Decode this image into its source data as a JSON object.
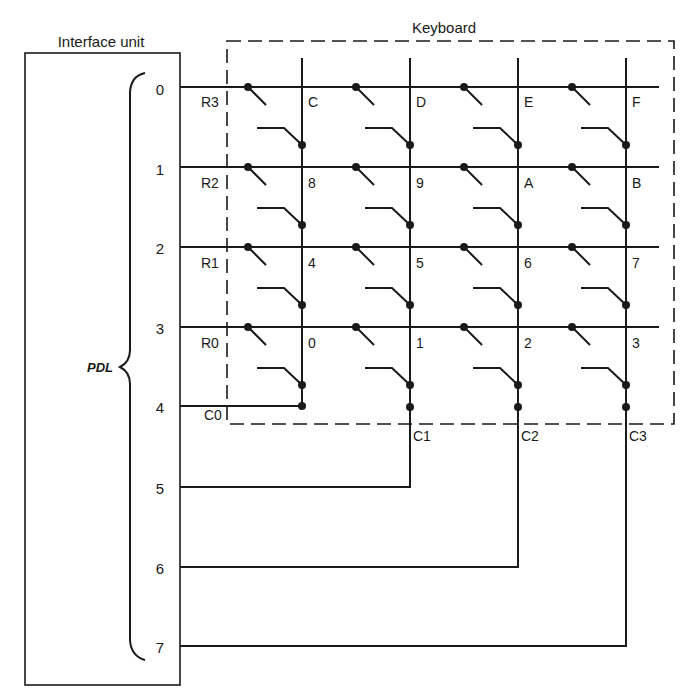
{
  "diagram": {
    "interface_unit": {
      "title": "Interface unit",
      "bus_label": "PDL",
      "pins": [
        "0",
        "1",
        "2",
        "3",
        "4",
        "5",
        "6",
        "7"
      ]
    },
    "keyboard": {
      "title": "Keyboard",
      "row_labels": [
        "R3",
        "R2",
        "R1",
        "R0"
      ],
      "column_labels": [
        "C0",
        "C1",
        "C2",
        "C3"
      ],
      "keys": [
        [
          "C",
          "D",
          "E",
          "F"
        ],
        [
          "8",
          "9",
          "A",
          "B"
        ],
        [
          "4",
          "5",
          "6",
          "7"
        ],
        [
          "0",
          "1",
          "2",
          "3"
        ]
      ]
    },
    "connections": [
      {
        "pin": "0",
        "signal": "R3"
      },
      {
        "pin": "1",
        "signal": "R2"
      },
      {
        "pin": "2",
        "signal": "R1"
      },
      {
        "pin": "3",
        "signal": "R0"
      },
      {
        "pin": "4",
        "signal": "C0"
      },
      {
        "pin": "5",
        "signal": "C1"
      },
      {
        "pin": "6",
        "signal": "C2"
      },
      {
        "pin": "7",
        "signal": "C3"
      }
    ],
    "colors": {
      "ink": "#1a1a1a",
      "background": "#ffffff"
    }
  }
}
